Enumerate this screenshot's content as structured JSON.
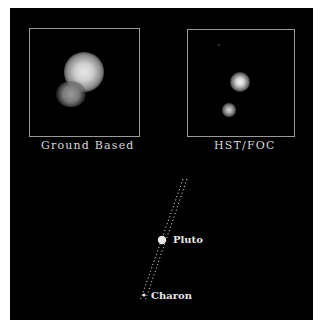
{
  "figure": {
    "panels": [
      {
        "id": "ground",
        "caption": "Ground Based"
      },
      {
        "id": "hst",
        "caption": "HST/FOC"
      }
    ],
    "diagram": {
      "labels": {
        "pluto": "Pluto",
        "charon": "Charon"
      }
    },
    "colors": {
      "background": "#000000",
      "frame": "#9a9a9a",
      "text": "#dcdcdc",
      "page": "#ffffff"
    }
  }
}
